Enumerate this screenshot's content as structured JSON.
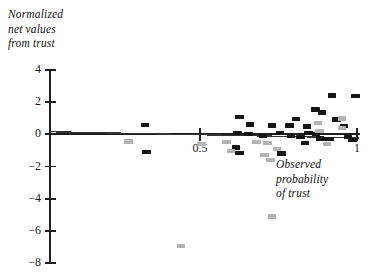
{
  "chart_data": {
    "type": "scatter",
    "title": "",
    "ylabel": "Normalized\nnet values\nfrom trust",
    "xlabel": "Observed\nprobability\nof trust",
    "xlim": [
      0.02,
      1.02
    ],
    "ylim": [
      -8.4,
      4.4
    ],
    "grid": false,
    "legend": null,
    "xticks": [
      0.5,
      1
    ],
    "xtick_labels": [
      "0.5",
      "1"
    ],
    "yticks": [
      4,
      2,
      0,
      -2,
      -4,
      -6,
      -8
    ],
    "ytick_labels": [
      "4",
      "2",
      "0",
      "−2",
      "−4",
      "−6",
      "−8"
    ],
    "annotations": [
      "Near-horizontal regression line drawn from x≈0.02 to x≈1.0, slightly declining from about y=0.15 to y=−0.25"
    ],
    "trend_line": {
      "x0": 0.025,
      "y0": 0.16,
      "x1": 1.005,
      "y1": -0.22,
      "color": "#333333"
    },
    "series": [
      {
        "name": "black markers",
        "color": "#141414",
        "points": [
          {
            "x": 0.325,
            "y": 0.6
          },
          {
            "x": 0.62,
            "y": 0.08
          },
          {
            "x": 0.755,
            "y": 0.08
          },
          {
            "x": 0.625,
            "y": 1.08
          },
          {
            "x": 0.66,
            "y": 0.62
          },
          {
            "x": 0.73,
            "y": 0.55
          },
          {
            "x": 0.785,
            "y": 0.55
          },
          {
            "x": 0.84,
            "y": 0.48
          },
          {
            "x": 0.868,
            "y": 1.55
          },
          {
            "x": 0.888,
            "y": 1.35
          },
          {
            "x": 0.92,
            "y": 2.42
          },
          {
            "x": 0.845,
            "y": 0.08
          },
          {
            "x": 0.87,
            "y": 0.0
          },
          {
            "x": 0.882,
            "y": -0.25
          },
          {
            "x": 0.898,
            "y": -0.28
          },
          {
            "x": 0.912,
            "y": -0.3
          },
          {
            "x": 0.935,
            "y": 0.92
          },
          {
            "x": 0.958,
            "y": 0.52
          },
          {
            "x": 0.972,
            "y": -0.18
          },
          {
            "x": 0.985,
            "y": -0.35
          },
          {
            "x": 0.995,
            "y": 2.38
          },
          {
            "x": 0.655,
            "y": 0.0
          },
          {
            "x": 0.7,
            "y": -0.1
          },
          {
            "x": 0.79,
            "y": -0.12
          },
          {
            "x": 0.82,
            "y": -0.18
          },
          {
            "x": 0.835,
            "y": -0.55
          },
          {
            "x": 0.615,
            "y": -0.82
          },
          {
            "x": 0.625,
            "y": -1.15
          },
          {
            "x": 0.33,
            "y": -1.1
          },
          {
            "x": 0.76,
            "y": -1.2
          },
          {
            "x": 0.805,
            "y": 0.95
          }
        ]
      },
      {
        "name": "gray markers",
        "color": "#b4b4b4",
        "points": [
          {
            "x": 0.272,
            "y": -0.45
          },
          {
            "x": 0.585,
            "y": -0.48
          },
          {
            "x": 0.68,
            "y": -0.48
          },
          {
            "x": 0.715,
            "y": -0.55
          },
          {
            "x": 0.745,
            "y": -0.9
          },
          {
            "x": 0.875,
            "y": 0.72
          },
          {
            "x": 0.88,
            "y": 0.22
          },
          {
            "x": 0.952,
            "y": 0.98
          },
          {
            "x": 0.952,
            "y": 0.4
          },
          {
            "x": 0.905,
            "y": -0.6
          },
          {
            "x": 0.598,
            "y": -1.05
          },
          {
            "x": 0.705,
            "y": -1.3
          },
          {
            "x": 0.725,
            "y": -1.58
          },
          {
            "x": 0.73,
            "y": -5.1
          },
          {
            "x": 0.44,
            "y": -6.95
          },
          {
            "x": 0.505,
            "y": -0.58
          }
        ]
      }
    ]
  },
  "axis": {
    "y_axis_label_lines": [
      "Normalized",
      "net values",
      "from trust"
    ],
    "x_axis_label_lines": [
      "Observed",
      "probability",
      "of trust"
    ]
  }
}
